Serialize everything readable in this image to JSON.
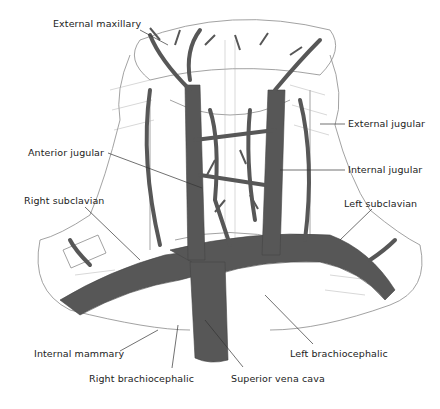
{
  "diagram": {
    "colors": {
      "vein": "#575757",
      "vein_light": "#7a7a7a",
      "tissue_line": "#8a8a8a",
      "background": "#ffffff",
      "label": "#222222"
    },
    "labels": [
      {
        "id": "external-maxillary",
        "text": "External maxillary",
        "x": 53,
        "y": 24
      },
      {
        "id": "external-jugular",
        "text": "External jugular",
        "x": 348,
        "y": 119
      },
      {
        "id": "anterior-jugular",
        "text": "Anterior jugular",
        "x": 28,
        "y": 148
      },
      {
        "id": "internal-jugular",
        "text": "Internal jugular",
        "x": 348,
        "y": 165
      },
      {
        "id": "right-subclavian",
        "text": "Right subclavian",
        "x": 24,
        "y": 196
      },
      {
        "id": "left-subclavian",
        "text": "Left subclavian",
        "x": 344,
        "y": 199
      },
      {
        "id": "internal-mammary",
        "text": "Internal mammary",
        "x": 34,
        "y": 348
      },
      {
        "id": "left-brachiocephalic",
        "text": "Left brachiocephalic",
        "x": 290,
        "y": 348
      },
      {
        "id": "right-brachiocephalic",
        "text": "Right brachiocephalic",
        "x": 89,
        "y": 373
      },
      {
        "id": "superior-vena-cava",
        "text": "Superior vena cava",
        "x": 231,
        "y": 373
      }
    ]
  }
}
